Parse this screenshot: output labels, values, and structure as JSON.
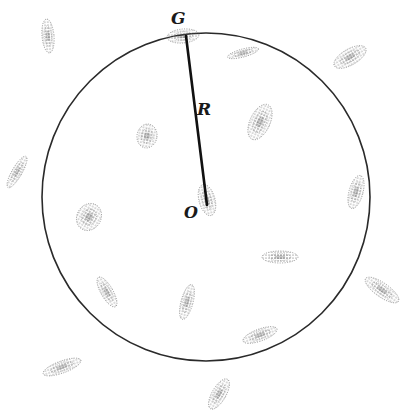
{
  "diagram": {
    "colors": {
      "ink": "#2a2a2a",
      "stipple": "#555555",
      "background": "#ffffff"
    },
    "circle": {
      "cx": 206,
      "cy": 197,
      "r": 164
    },
    "radius_line": {
      "x1": 186,
      "y1": 36,
      "x2": 207,
      "y2": 205
    },
    "labels": {
      "G": "G",
      "R": "R",
      "O": "O"
    },
    "galaxies": [
      {
        "id": "g1",
        "cx": 48,
        "cy": 36,
        "rx": 6,
        "ry": 17,
        "rot": -5
      },
      {
        "id": "G",
        "cx": 183,
        "cy": 36,
        "rx": 16,
        "ry": 7,
        "rot": -5
      },
      {
        "id": "g3",
        "cx": 243,
        "cy": 53,
        "rx": 16,
        "ry": 4,
        "rot": -15
      },
      {
        "id": "g4",
        "cx": 350,
        "cy": 57,
        "rx": 18,
        "ry": 8,
        "rot": -30
      },
      {
        "id": "g5",
        "cx": 147,
        "cy": 136,
        "rx": 10,
        "ry": 12,
        "rot": 10
      },
      {
        "id": "g6",
        "cx": 260,
        "cy": 122,
        "rx": 10,
        "ry": 19,
        "rot": 25
      },
      {
        "id": "g7",
        "cx": 17,
        "cy": 172,
        "rx": 5,
        "ry": 18,
        "rot": 30
      },
      {
        "id": "g8",
        "cx": 89,
        "cy": 217,
        "rx": 12,
        "ry": 14,
        "rot": 30
      },
      {
        "id": "O",
        "cx": 207,
        "cy": 200,
        "rx": 8,
        "ry": 16,
        "rot": -15
      },
      {
        "id": "g10",
        "cx": 356,
        "cy": 192,
        "rx": 7,
        "ry": 17,
        "rot": 15
      },
      {
        "id": "g11",
        "cx": 280,
        "cy": 257,
        "rx": 18,
        "ry": 6,
        "rot": 0
      },
      {
        "id": "g12",
        "cx": 107,
        "cy": 292,
        "rx": 6,
        "ry": 17,
        "rot": -30
      },
      {
        "id": "g13",
        "cx": 187,
        "cy": 302,
        "rx": 6,
        "ry": 18,
        "rot": 15
      },
      {
        "id": "g14",
        "cx": 260,
        "cy": 335,
        "rx": 18,
        "ry": 6,
        "rot": -20
      },
      {
        "id": "g15",
        "cx": 382,
        "cy": 290,
        "rx": 20,
        "ry": 7,
        "rot": 35
      },
      {
        "id": "g16",
        "cx": 62,
        "cy": 367,
        "rx": 20,
        "ry": 6,
        "rot": -20
      },
      {
        "id": "g17",
        "cx": 219,
        "cy": 394,
        "rx": 7,
        "ry": 17,
        "rot": 30
      }
    ]
  }
}
